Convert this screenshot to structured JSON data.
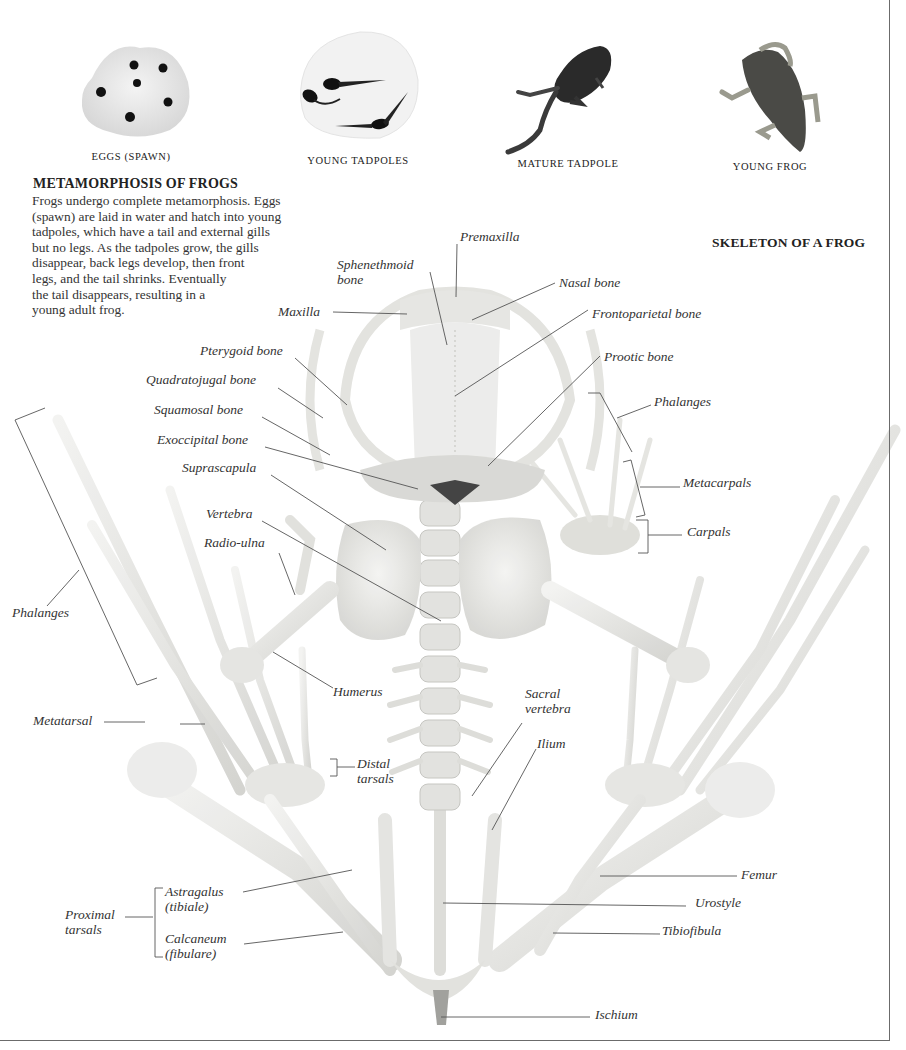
{
  "stages": [
    {
      "id": "eggs",
      "caption": "EGGS (SPAWN)",
      "icon": "frog-spawn-image"
    },
    {
      "id": "young-tadpoles",
      "caption": "YOUNG TADPOLES",
      "icon": "young-tadpoles-image"
    },
    {
      "id": "mature-tadpole",
      "caption": "MATURE TADPOLE",
      "icon": "mature-tadpole-image"
    },
    {
      "id": "young-frog",
      "caption": "YOUNG FROG",
      "icon": "young-frog-image"
    }
  ],
  "metamorphosis": {
    "title": "METAMORPHOSIS OF FROGS",
    "lines": [
      "Frogs undergo complete metamorphosis. Eggs",
      "(spawn) are laid in water and hatch into young",
      "tadpoles, which have a tail and external gills",
      "but no legs. As the tadpoles grow, the gills",
      "disappear, back legs develop, then front",
      "legs, and the tail shrinks. Eventually",
      "the tail disappears, resulting in a",
      "young adult frog."
    ]
  },
  "skeleton": {
    "title": "SKELETON OF A FROG",
    "labels": {
      "premaxilla": "Premaxilla",
      "sphenethmoid": [
        "Sphenethmoid",
        "bone"
      ],
      "nasal": "Nasal bone",
      "maxilla": "Maxilla",
      "frontoparietal": "Frontoparietal bone",
      "pterygoid": "Pterygoid bone",
      "prootic": "Prootic bone",
      "quadratojugal": "Quadratojugal bone",
      "squamosal": "Squamosal bone",
      "phalanges_right": "Phalanges",
      "exoccipital": "Exoccipital bone",
      "metacarpals": "Metacarpals",
      "suprascapula": "Suprascapula",
      "vertebra": "Vertebra",
      "carpals": "Carpals",
      "radio_ulna": "Radio-ulna",
      "phalanges_left": "Phalanges",
      "humerus": "Humerus",
      "sacral_vertebra": [
        "Sacral",
        "vertebra"
      ],
      "metatarsal": "Metatarsal",
      "ilium": "Ilium",
      "distal_tarsals": [
        "Distal",
        "tarsals"
      ],
      "femur": "Femur",
      "astragalus": [
        "Astragalus",
        "(tibiale)"
      ],
      "urostyle": "Urostyle",
      "proximal_tarsals": [
        "Proximal",
        "tarsals"
      ],
      "calcaneum": [
        "Calcaneum",
        "(fibulare)"
      ],
      "tibiofibula": "Tibiofibula",
      "ischium": "Ischium"
    }
  },
  "colors": {
    "bone": "#e9e9e6",
    "bone_shadow": "#c9c9c5",
    "leader_line": "#555555",
    "frame": "#6b6b6b"
  }
}
